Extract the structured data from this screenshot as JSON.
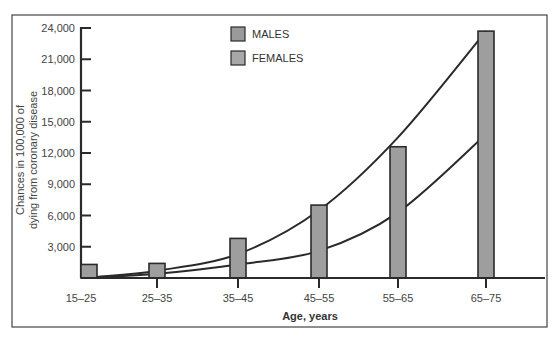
{
  "chart_data": {
    "type": "bar",
    "title": "",
    "xlabel": "Age, years",
    "ylabel_lines": [
      "Chances in 100,000 of",
      "dying from coronary disease"
    ],
    "ylabel": "Chances in 100,000 of dying from coronary disease",
    "categories": [
      "15–25",
      "25–35",
      "35–45",
      "45–55",
      "55–65",
      "65–75"
    ],
    "y_ticks": [
      3000,
      6000,
      9000,
      12000,
      15000,
      18000,
      21000,
      24000
    ],
    "y_tick_labels": [
      "3,000",
      "6,000",
      "9,000",
      "12,000",
      "15,000",
      "18,000",
      "21,000",
      "24,000"
    ],
    "ylim": [
      0,
      24000
    ],
    "grid": false,
    "legend_position": "top-center",
    "legend": [
      {
        "label": "MALES",
        "color": "#9a9a9a"
      },
      {
        "label": "FEMALES",
        "color": "#a8a8a8"
      }
    ],
    "series": [
      {
        "name": "Bars (age group)",
        "kind": "bar",
        "values": [
          1300,
          1400,
          3800,
          7000,
          12600,
          23700
        ]
      },
      {
        "name": "MALES",
        "kind": "curve",
        "values": [
          100,
          700,
          2300,
          6500,
          13500,
          23700
        ]
      },
      {
        "name": "FEMALES",
        "kind": "curve",
        "values": [
          50,
          400,
          1300,
          2600,
          6300,
          13800
        ]
      }
    ],
    "colors": {
      "bar_fill": "#9e9e9e",
      "bar_stroke": "#2a2a2a",
      "line": "#2a2a2a",
      "frame": "#444444"
    }
  }
}
